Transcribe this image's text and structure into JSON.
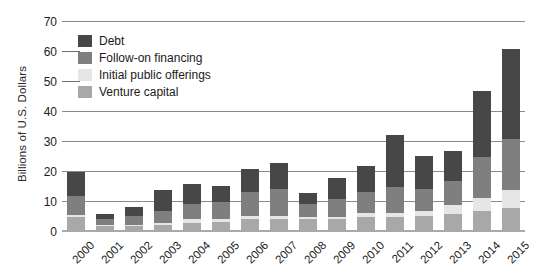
{
  "chart_data": {
    "type": "bar",
    "stacked": true,
    "title": "",
    "xlabel": "",
    "ylabel": "Billions of U.S. Dollars",
    "ylim": [
      0,
      70
    ],
    "yticks": [
      0,
      10,
      20,
      30,
      40,
      50,
      60,
      70
    ],
    "grid": true,
    "legend_position": "top-left",
    "categories": [
      "2000",
      "2001",
      "2002",
      "2003",
      "2004",
      "2005",
      "2006",
      "2007",
      "2008",
      "2009",
      "2010",
      "2011",
      "2012",
      "2013",
      "2014",
      "2015"
    ],
    "series": [
      {
        "name": "Venture capital",
        "color": "#a8a8a8",
        "values": [
          5.0,
          2.0,
          2.0,
          2.5,
          3.0,
          3.5,
          4.5,
          4.5,
          4.5,
          4.5,
          5.0,
          5.0,
          5.5,
          6.0,
          7.0,
          8.0
        ]
      },
      {
        "name": "Initial public offerings",
        "color": "#e6e6e6",
        "values": [
          0.8,
          0.4,
          0.3,
          0.5,
          1.5,
          1.0,
          1.0,
          1.0,
          0.5,
          0.5,
          1.5,
          1.5,
          1.5,
          3.0,
          4.5,
          6.0
        ]
      },
      {
        "name": "Follow-on financing",
        "color": "#7f7f7f",
        "values": [
          6.2,
          2.1,
          3.2,
          4.0,
          5.0,
          5.5,
          8.0,
          9.0,
          4.5,
          6.0,
          7.0,
          8.5,
          7.5,
          8.0,
          13.5,
          17.0
        ]
      },
      {
        "name": "Debt",
        "color": "#474747",
        "values": [
          8.0,
          1.5,
          3.0,
          7.0,
          6.5,
          5.5,
          7.5,
          8.5,
          3.5,
          7.0,
          8.5,
          17.5,
          11.0,
          10.0,
          22.0,
          30.0
        ]
      }
    ],
    "totals": [
      20.0,
      6.0,
      8.5,
      14.0,
      16.0,
      15.5,
      21.0,
      23.0,
      13.0,
      18.0,
      22.0,
      32.5,
      25.5,
      27.0,
      47.0,
      61.0
    ]
  },
  "legend": {
    "items": [
      {
        "label": "Debt",
        "color": "#474747"
      },
      {
        "label": "Follow-on financing",
        "color": "#7f7f7f"
      },
      {
        "label": "Initial public offerings",
        "color": "#e6e6e6"
      },
      {
        "label": "Venture capital",
        "color": "#a8a8a8"
      }
    ]
  },
  "axis": {
    "y_title": "Billions of U.S. Dollars",
    "y_tick_labels": [
      "70",
      "60",
      "50",
      "40",
      "30",
      "20",
      "10",
      "0"
    ],
    "x_tick_labels": [
      "2000",
      "2001",
      "2002",
      "2003",
      "2004",
      "2005",
      "2006",
      "2007",
      "2008",
      "2009",
      "2010",
      "2011",
      "2012",
      "2013",
      "2014",
      "2015"
    ]
  }
}
